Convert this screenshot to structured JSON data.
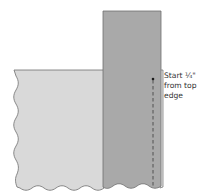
{
  "diagram": {
    "annotation": {
      "lines": [
        "Start ¼\"",
        "from top",
        "edge"
      ]
    },
    "colors": {
      "background": "#ffffff",
      "bottom_fabric_fill": "#d9d9d9",
      "top_strip_fill": "#a9a9a9",
      "outline": "#6e6e6e",
      "stitch_line": "#3a3a3a",
      "label_text": "#333333"
    },
    "elements": [
      {
        "name": "bottom-fabric-panel",
        "shape": "rect-wavy-left-bottom",
        "x": 14,
        "y": 70,
        "width": 90,
        "height": 118
      },
      {
        "name": "top-fabric-strip",
        "shape": "rect-wavy-bottom",
        "x": 103,
        "y": 11,
        "width": 58,
        "height": 177
      },
      {
        "name": "under-layer-edge",
        "shape": "rect-outline",
        "x": 160,
        "y": 70,
        "width": 3,
        "height": 118
      },
      {
        "name": "stitch-line",
        "shape": "dashed-line",
        "x": 153,
        "y1": 79,
        "y2": 188
      },
      {
        "name": "stitch-start-dot",
        "shape": "dot",
        "x": 153,
        "y": 79
      }
    ]
  }
}
